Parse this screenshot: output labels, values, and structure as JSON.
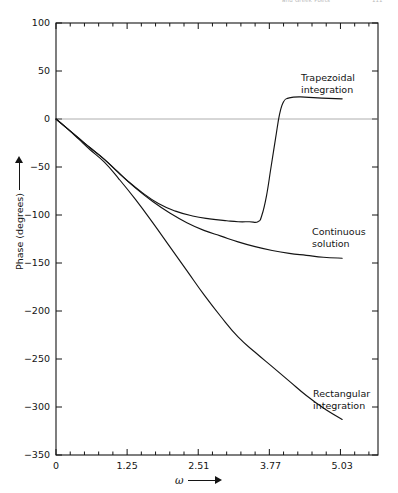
{
  "header": {
    "running_head": "and Greek Poets",
    "page_number": "111"
  },
  "chart_data": {
    "type": "line",
    "title": "",
    "xlabel": "ω",
    "ylabel": "Phase (degrees)",
    "xlim": [
      0,
      5.66
    ],
    "ylim": [
      -350,
      100
    ],
    "grid": false,
    "legend_position": "inline-annotations",
    "zero_line": true,
    "x_ticks": [
      {
        "value": 0,
        "label": "0"
      },
      {
        "value": 1.25,
        "label": "1.25"
      },
      {
        "value": 2.51,
        "label": "2.51"
      },
      {
        "value": 3.77,
        "label": "3.77"
      },
      {
        "value": 5.03,
        "label": "5.03"
      }
    ],
    "x_minor_tick_count_per_interval": 5,
    "y_ticks": [
      {
        "value": 100,
        "label": "100"
      },
      {
        "value": 50,
        "label": "50"
      },
      {
        "value": 0,
        "label": "0"
      },
      {
        "value": -50,
        "label": "−50"
      },
      {
        "value": -100,
        "label": "−100"
      },
      {
        "value": -150,
        "label": "−150"
      },
      {
        "value": -200,
        "label": "−200"
      },
      {
        "value": -250,
        "label": "−250"
      },
      {
        "value": -300,
        "label": "−300"
      },
      {
        "value": -350,
        "label": "−350"
      }
    ],
    "series": [
      {
        "name": "Trapezoidal integration",
        "label": "Trapezoidal\nintegration",
        "label_line1": "Trapezoidal",
        "label_line2": "integration",
        "color": "#141414",
        "points": [
          [
            0.0,
            0
          ],
          [
            0.2,
            -10
          ],
          [
            0.4,
            -20
          ],
          [
            0.6,
            -30
          ],
          [
            0.85,
            -42
          ],
          [
            1.05,
            -53
          ],
          [
            1.25,
            -64
          ],
          [
            1.5,
            -76
          ],
          [
            1.8,
            -88
          ],
          [
            2.1,
            -96
          ],
          [
            2.4,
            -101
          ],
          [
            2.7,
            -104
          ],
          [
            3.0,
            -106
          ],
          [
            3.2,
            -107
          ],
          [
            3.4,
            -107
          ],
          [
            3.55,
            -107
          ],
          [
            3.62,
            -100
          ],
          [
            3.7,
            -80
          ],
          [
            3.78,
            -50
          ],
          [
            3.86,
            -20
          ],
          [
            3.93,
            5
          ],
          [
            4.0,
            18
          ],
          [
            4.1,
            22
          ],
          [
            4.3,
            23
          ],
          [
            4.6,
            22
          ],
          [
            5.03,
            21
          ]
        ]
      },
      {
        "name": "Continuous solution",
        "label": "Continuous\nsolution",
        "label_line1": "Continuous",
        "label_line2": "solution",
        "color": "#141414",
        "points": [
          [
            0.0,
            0
          ],
          [
            0.2,
            -10
          ],
          [
            0.4,
            -20
          ],
          [
            0.6,
            -30
          ],
          [
            0.85,
            -42
          ],
          [
            1.1,
            -56
          ],
          [
            1.4,
            -72
          ],
          [
            1.7,
            -86
          ],
          [
            2.0,
            -98
          ],
          [
            2.3,
            -108
          ],
          [
            2.6,
            -116
          ],
          [
            2.9,
            -122
          ],
          [
            3.2,
            -128
          ],
          [
            3.5,
            -133
          ],
          [
            3.8,
            -137
          ],
          [
            4.1,
            -140
          ],
          [
            4.4,
            -142
          ],
          [
            4.7,
            -144
          ],
          [
            5.03,
            -145
          ]
        ]
      },
      {
        "name": "Rectangular integration",
        "label": "Rectangular\nintegration",
        "label_line1": "Rectangular",
        "label_line2": "integration",
        "color": "#141414",
        "points": [
          [
            0.0,
            0
          ],
          [
            0.2,
            -10
          ],
          [
            0.4,
            -21
          ],
          [
            0.6,
            -32
          ],
          [
            0.85,
            -45
          ],
          [
            1.1,
            -62
          ],
          [
            1.4,
            -84
          ],
          [
            1.7,
            -108
          ],
          [
            2.0,
            -133
          ],
          [
            2.3,
            -158
          ],
          [
            2.6,
            -183
          ],
          [
            2.9,
            -206
          ],
          [
            3.2,
            -227
          ],
          [
            3.5,
            -243
          ],
          [
            3.8,
            -258
          ],
          [
            4.1,
            -273
          ],
          [
            4.4,
            -288
          ],
          [
            4.7,
            -301
          ],
          [
            5.03,
            -313
          ]
        ]
      }
    ]
  }
}
